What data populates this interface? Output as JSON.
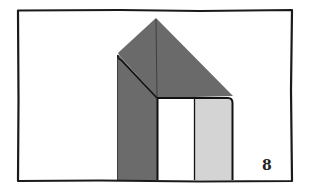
{
  "diagram": {
    "type": "origami-step",
    "step_number": "8",
    "colors": {
      "frame": "#1a1a1a",
      "dark_paper": "#6b6b6b",
      "light_paper": "#d4d4d4",
      "white_paper": "#ffffff",
      "line": "#111111"
    },
    "elements": [
      {
        "name": "frame",
        "description": "hand-drawn rectangular border"
      },
      {
        "name": "roof-triangle",
        "description": "dark gray folded top with apex"
      },
      {
        "name": "left-flap",
        "description": "dark gray vertical left column folded behind"
      },
      {
        "name": "center-crease",
        "description": "vertical line from apex to horizontal edge"
      },
      {
        "name": "white-panel",
        "description": "white rectangular panel, lower center"
      },
      {
        "name": "light-gray-panel",
        "description": "light gray rectangular panel, lower right"
      }
    ]
  }
}
